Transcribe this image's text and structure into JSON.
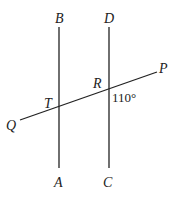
{
  "diagram": {
    "points": {
      "B": "B",
      "A": "A",
      "D": "D",
      "C": "C",
      "P": "P",
      "Q": "Q",
      "R": "R",
      "T": "T"
    },
    "angle_label": "110°",
    "lines": [
      {
        "name": "BA",
        "from": "B",
        "to": "A"
      },
      {
        "name": "DC",
        "from": "D",
        "to": "C"
      },
      {
        "name": "QP",
        "from": "Q",
        "to": "P"
      }
    ]
  }
}
